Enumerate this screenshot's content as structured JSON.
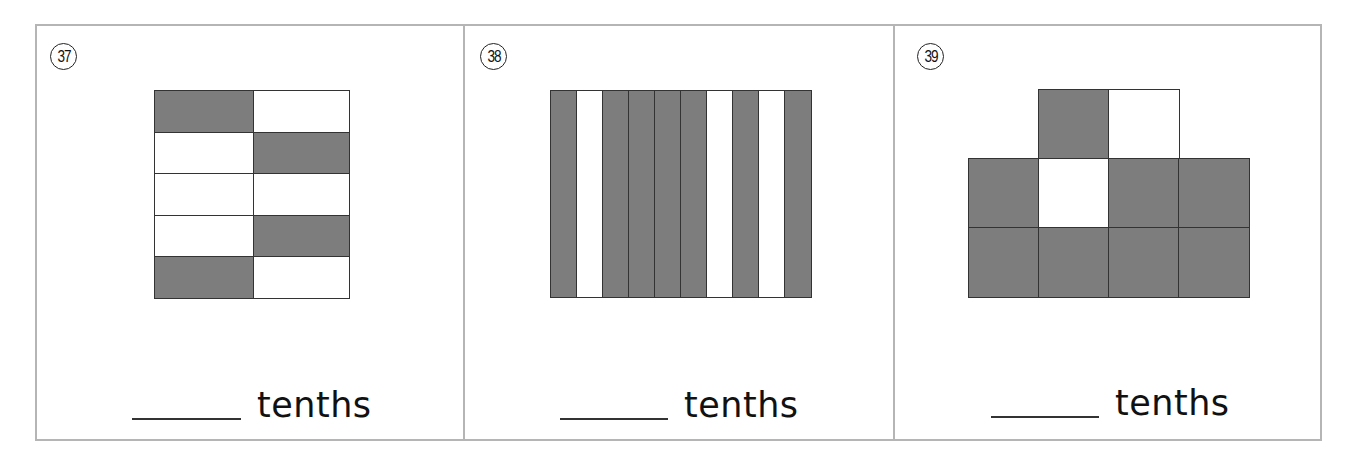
{
  "worksheet": {
    "unit_word": "tenths",
    "shade_color": "#7d7d7d",
    "problems": [
      {
        "number": "37",
        "number_glyph": "㊲",
        "figure": "5x2 grid of rectangles",
        "total_parts": 10,
        "shaded_parts": 4,
        "grid": [
          [
            1,
            0
          ],
          [
            0,
            1
          ],
          [
            0,
            0
          ],
          [
            0,
            1
          ],
          [
            1,
            0
          ]
        ],
        "answer_blank": "",
        "label": "tenths"
      },
      {
        "number": "38",
        "number_glyph": "㊳",
        "figure": "10 vertical strips",
        "total_parts": 10,
        "shaded_parts": 7,
        "strips": [
          1,
          0,
          1,
          1,
          1,
          1,
          0,
          1,
          0,
          1
        ],
        "answer_blank": "",
        "label": "tenths"
      },
      {
        "number": "39",
        "number_glyph": "㊴",
        "figure": "10 squares in stepped shape (2 on top, 4, 4)",
        "total_parts": 10,
        "shaded_parts": 8,
        "rows": [
          {
            "offset": 1,
            "cells": [
              1,
              0
            ]
          },
          {
            "offset": 0,
            "cells": [
              1,
              0,
              1,
              1
            ]
          },
          {
            "offset": 0,
            "cells": [
              1,
              1,
              1,
              1
            ]
          }
        ],
        "answer_blank": "",
        "label": "tenths"
      }
    ]
  }
}
